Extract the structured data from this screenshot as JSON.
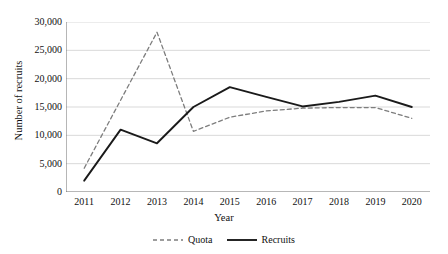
{
  "chart_data": {
    "type": "line",
    "title": "",
    "xlabel": "Year",
    "ylabel": "Number of recruits",
    "categories": [
      "2011",
      "2012",
      "2013",
      "2014",
      "2015",
      "2016",
      "2017",
      "2018",
      "2019",
      "2020"
    ],
    "x": [
      2011,
      2012,
      2013,
      2014,
      2015,
      2016,
      2017,
      2018,
      2019,
      2020
    ],
    "ylim": [
      0,
      30000
    ],
    "ytick_labels": [
      "30,000",
      "25,000",
      "20,000",
      "15,000",
      "10,000",
      "5,000",
      "0"
    ],
    "ytick_values": [
      30000,
      25000,
      20000,
      15000,
      10000,
      5000,
      0
    ],
    "grid": true,
    "legend_position": "bottom",
    "series": [
      {
        "name": "Quota",
        "style": "dashed",
        "color": "#7d7d7d",
        "values": [
          4200,
          16200,
          28200,
          10700,
          13200,
          14300,
          14800,
          14900,
          14900,
          13000
        ]
      },
      {
        "name": "Recruits",
        "style": "solid",
        "color": "#1a1a1a",
        "values": [
          2000,
          11000,
          8600,
          15000,
          18500,
          16800,
          15100,
          15900,
          17000,
          15000
        ]
      }
    ]
  },
  "axis": {
    "y_title": "Number of recruits",
    "x_title": "Year"
  },
  "colors": {
    "quota": "#7d7d7d",
    "recruits": "#1a1a1a",
    "gridline": "#d9d9d9",
    "axis": "#6e6e6e",
    "background": "#ffffff"
  }
}
